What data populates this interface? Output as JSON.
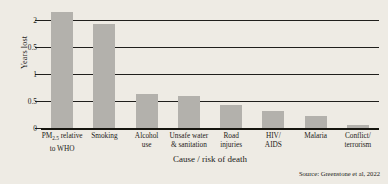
{
  "chart_data": {
    "type": "bar",
    "title": "",
    "xlabel": "Cause / risk of death",
    "ylabel": "Years lost",
    "ylim": [
      0,
      2.2
    ],
    "grid": true,
    "legend": "none",
    "source_note": "Source: Greenstone et al, 2022",
    "yticks": [
      {
        "value": 2,
        "label": "2"
      },
      {
        "value": 1.5,
        "label": "0.5"
      },
      {
        "value": 1,
        "label": "1"
      },
      {
        "value": 0.5,
        "label": "0.5"
      },
      {
        "value": 0,
        "label": "0"
      }
    ],
    "categories": [
      "PM2.5 relative to WHO",
      "Smoking",
      "Alcohol use",
      "Unsafe water & sanitation",
      "Road injuries",
      "HIV/AIDS",
      "Malaria",
      "Conflict/terrorism"
    ],
    "category_labels": [
      {
        "line1_pre": "PM",
        "line1_sub": "2.5",
        "line1_post": " relative",
        "line2": "to WHO"
      },
      {
        "line1_pre": "Smoking",
        "line1_sub": "",
        "line1_post": "",
        "line2": ""
      },
      {
        "line1_pre": "Alcohol",
        "line1_sub": "",
        "line1_post": "",
        "line2": "use"
      },
      {
        "line1_pre": "Unsafe water",
        "line1_sub": "",
        "line1_post": "",
        "line2": "& sanitation"
      },
      {
        "line1_pre": "Road",
        "line1_sub": "",
        "line1_post": "",
        "line2": "injuries"
      },
      {
        "line1_pre": "HIV/",
        "line1_sub": "",
        "line1_post": "",
        "line2": "AIDS"
      },
      {
        "line1_pre": "Malaria",
        "line1_sub": "",
        "line1_post": "",
        "line2": ""
      },
      {
        "line1_pre": "Conflict/",
        "line1_sub": "",
        "line1_post": "",
        "line2": "terrorism"
      }
    ],
    "values": [
      2.15,
      1.92,
      0.63,
      0.6,
      0.42,
      0.32,
      0.23,
      0.05
    ],
    "bar_color": "#b3b1ac",
    "axis_color": "#201f1c",
    "background_color": "#eeebe4"
  }
}
